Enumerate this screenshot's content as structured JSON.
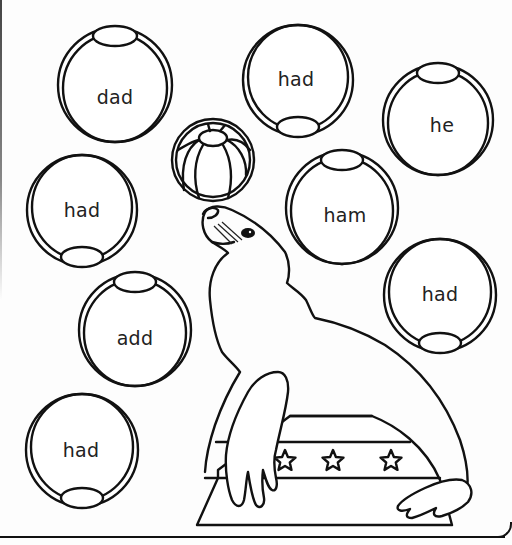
{
  "worksheet": {
    "title": "Seal with word balls coloring page",
    "colors": {
      "ink": "#111111",
      "paper": "#fdfdfd"
    },
    "balls": [
      {
        "id": "ball-dad",
        "word": "dad",
        "cx": 115,
        "cy": 85,
        "r": 57,
        "patch": "top"
      },
      {
        "id": "ball-had-top",
        "word": "had",
        "cx": 298,
        "cy": 80,
        "r": 55,
        "patch": "bottom"
      },
      {
        "id": "ball-he",
        "word": "he",
        "cx": 438,
        "cy": 120,
        "r": 55,
        "patch": "top"
      },
      {
        "id": "ball-had-left",
        "word": "had",
        "cx": 82,
        "cy": 210,
        "r": 55,
        "patch": "bottom"
      },
      {
        "id": "ball-ham",
        "word": "ham",
        "cx": 342,
        "cy": 208,
        "r": 56,
        "patch": "top"
      },
      {
        "id": "ball-add",
        "word": "add",
        "cx": 135,
        "cy": 330,
        "r": 56,
        "patch": "top"
      },
      {
        "id": "ball-had-right",
        "word": "had",
        "cx": 440,
        "cy": 295,
        "r": 56,
        "patch": "bottom"
      },
      {
        "id": "ball-had-bottom",
        "word": "had",
        "cx": 82,
        "cy": 450,
        "r": 56,
        "patch": "bottom"
      }
    ],
    "seal_ball": {
      "cx": 213,
      "cy": 160,
      "r": 40
    },
    "pedestal": {
      "stars": 3
    }
  }
}
